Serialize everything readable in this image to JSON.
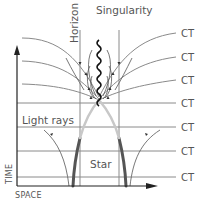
{
  "diagram": {
    "title": "Singularity",
    "labels": {
      "singularity": "Singularity",
      "horizon": "Horizon",
      "light_rays": "Light rays",
      "star": "Star",
      "time_axis": "TIME",
      "space_axis": "SPACE"
    },
    "ct_labels": [
      "CT",
      "CT",
      "CT",
      "CT",
      "CT",
      "CT",
      "CT"
    ],
    "colors": {
      "line": "#808080",
      "text": "#555555",
      "star_dark": "#555555",
      "star_light": "#c8c8c8",
      "singularity": "#111111",
      "axis": "#222222"
    }
  }
}
